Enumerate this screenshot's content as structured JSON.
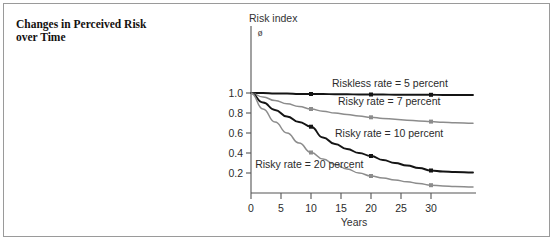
{
  "figure": {
    "title": "Changes in Perceived Risk over Time",
    "title_line1": "Changes in Perceived Risk",
    "title_line2": "over Time",
    "border_color": "#9a9a9a",
    "background": "#ffffff"
  },
  "chart_data": {
    "type": "line",
    "title": "Changes in Perceived Risk over Time",
    "xlabel": "Years",
    "ylabel": "Risk index",
    "ylabel_symbol": "ø",
    "xlim": [
      0,
      37
    ],
    "ylim": [
      0,
      1.08
    ],
    "xticks": [
      0,
      5,
      10,
      15,
      20,
      25,
      30
    ],
    "xtick_labels": [
      "0",
      "5",
      "10",
      "15",
      "20",
      "25",
      "30"
    ],
    "yticks": [
      0.2,
      0.4,
      0.6,
      0.8,
      1.0
    ],
    "ytick_labels": [
      "0.2",
      "0.4",
      "0.6",
      "0.8",
      "1.0"
    ],
    "y_origin_label": "0",
    "grid": false,
    "legend_position": "inline-annotations",
    "marker_years": [
      10,
      20,
      30
    ],
    "series": [
      {
        "name": "Riskless rate = 5 percent",
        "label": "Riskless rate = 5 percent",
        "rate_percent": 5,
        "color": "#141414",
        "x": [
          0,
          2,
          4,
          6,
          8,
          10,
          12,
          14,
          16,
          18,
          20,
          22,
          24,
          26,
          28,
          30,
          32,
          34,
          37
        ],
        "values": [
          1.0,
          1.0,
          0.995,
          0.995,
          0.99,
          0.99,
          0.99,
          0.988,
          0.988,
          0.985,
          0.985,
          0.985,
          0.983,
          0.983,
          0.982,
          0.982,
          0.98,
          0.98,
          0.98
        ],
        "markers": [
          {
            "x": 10,
            "y": 0.99
          },
          {
            "x": 20,
            "y": 0.985
          },
          {
            "x": 30,
            "y": 0.982
          }
        ]
      },
      {
        "name": "Risky rate = 7 percent",
        "label": "Risky rate = 7 percent",
        "rate_percent": 7,
        "color": "#8c8c8c",
        "x": [
          0,
          2,
          4,
          6,
          8,
          10,
          12,
          14,
          16,
          18,
          20,
          22,
          24,
          26,
          28,
          30,
          32,
          34,
          37
        ],
        "values": [
          1.0,
          0.96,
          0.925,
          0.893,
          0.865,
          0.84,
          0.818,
          0.8,
          0.784,
          0.77,
          0.757,
          0.746,
          0.737,
          0.728,
          0.721,
          0.714,
          0.708,
          0.703,
          0.697
        ],
        "markers": [
          {
            "x": 10,
            "y": 0.84
          },
          {
            "x": 20,
            "y": 0.757
          },
          {
            "x": 30,
            "y": 0.714
          }
        ]
      },
      {
        "name": "Risky rate = 10 percent",
        "label": "Risky rate = 10 percent",
        "rate_percent": 10,
        "color": "#141414",
        "x": [
          0,
          2,
          4,
          6,
          8,
          10,
          12,
          14,
          16,
          18,
          20,
          22,
          24,
          26,
          28,
          30,
          32,
          34,
          37
        ],
        "values": [
          1.0,
          0.905,
          0.83,
          0.765,
          0.71,
          0.663,
          0.555,
          0.49,
          0.44,
          0.4,
          0.37,
          0.33,
          0.3,
          0.275,
          0.25,
          0.225,
          0.215,
          0.21,
          0.205
        ],
        "markers": [
          {
            "x": 10,
            "y": 0.663
          },
          {
            "x": 20,
            "y": 0.37
          },
          {
            "x": 30,
            "y": 0.225
          }
        ]
      },
      {
        "name": "Risky rate = 20 percent",
        "label": "Risky rate = 20 percent",
        "rate_percent": 20,
        "color": "#8c8c8c",
        "x": [
          0,
          2,
          4,
          6,
          8,
          10,
          12,
          14,
          16,
          18,
          20,
          22,
          24,
          26,
          28,
          30,
          32,
          34,
          37
        ],
        "values": [
          1.0,
          0.84,
          0.71,
          0.6,
          0.5,
          0.405,
          0.34,
          0.285,
          0.24,
          0.2,
          0.17,
          0.15,
          0.13,
          0.112,
          0.095,
          0.078,
          0.07,
          0.065,
          0.06
        ],
        "markers": [
          {
            "x": 10,
            "y": 0.405
          },
          {
            "x": 20,
            "y": 0.17
          },
          {
            "x": 30,
            "y": 0.078
          }
        ]
      }
    ],
    "annotations": [
      {
        "text": "Riskless rate = 5 percent",
        "x": 13.5,
        "y": 1.06
      },
      {
        "text": "Risky rate = 7 percent",
        "x": 14.5,
        "y": 0.885
      },
      {
        "text": "Risky rate = 10 percent",
        "x": 14.0,
        "y": 0.565
      },
      {
        "text": "Risky rate = 20 percent",
        "x": 0.7,
        "y": 0.255
      }
    ]
  }
}
